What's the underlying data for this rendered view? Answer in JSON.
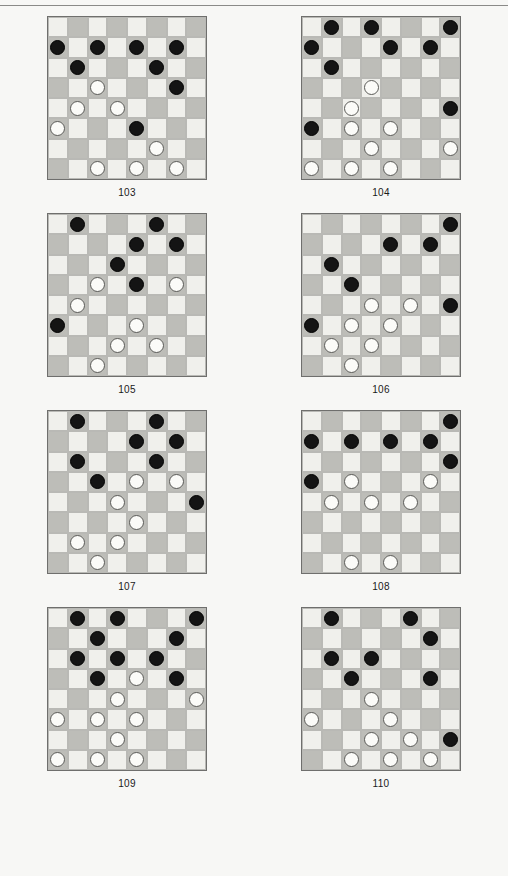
{
  "page": {
    "background_color": "#f7f7f5",
    "has_top_rule": true,
    "rule_color": "#8a8a88"
  },
  "board_style": {
    "light_square_color": "#f0f0ec",
    "dark_square_color": "#bdbdb8",
    "black_piece_color": "#141414",
    "white_piece_color": "#fbfbf8",
    "size": 8
  },
  "puzzles": [
    {
      "label": "103",
      "rows": [
        [
          "",
          "",
          "",
          "",
          "",
          "",
          "",
          ""
        ],
        [
          "b",
          "",
          "b",
          "",
          "b",
          "",
          "b",
          ""
        ],
        [
          "",
          "b",
          "",
          "",
          "",
          "b",
          "",
          ""
        ],
        [
          "",
          "",
          "w",
          "",
          "",
          "",
          "b",
          ""
        ],
        [
          "",
          "w",
          "",
          "w",
          "",
          "",
          "",
          ""
        ],
        [
          "w",
          "",
          "",
          "",
          "b",
          "",
          "",
          ""
        ],
        [
          "",
          "",
          "",
          "",
          "",
          "w",
          "",
          ""
        ],
        [
          "",
          "",
          "w",
          "",
          "w",
          "",
          "w",
          ""
        ]
      ]
    },
    {
      "label": "104",
      "rows": [
        [
          "",
          "b",
          "",
          "b",
          "",
          "",
          "",
          "b"
        ],
        [
          "b",
          "",
          "",
          "",
          "b",
          "",
          "b",
          ""
        ],
        [
          "",
          "b",
          "",
          "",
          "",
          "",
          "",
          ""
        ],
        [
          "",
          "",
          "",
          "w",
          "",
          "",
          "",
          ""
        ],
        [
          "",
          "",
          "w",
          "",
          "",
          "",
          "",
          "b"
        ],
        [
          "b",
          "",
          "w",
          "",
          "w",
          "",
          "",
          ""
        ],
        [
          "",
          "",
          "",
          "w",
          "",
          "",
          "",
          "w"
        ],
        [
          "w",
          "",
          "w",
          "",
          "w",
          "",
          "",
          ""
        ]
      ]
    },
    {
      "label": "105",
      "rows": [
        [
          "",
          "b",
          "",
          "",
          "",
          "b",
          "",
          ""
        ],
        [
          "",
          "",
          "",
          "",
          "b",
          "",
          "b",
          ""
        ],
        [
          "",
          "",
          "",
          "b",
          "",
          "",
          "",
          ""
        ],
        [
          "",
          "",
          "w",
          "",
          "b",
          "",
          "w",
          ""
        ],
        [
          "",
          "w",
          "",
          "",
          "",
          "",
          "",
          ""
        ],
        [
          "b",
          "",
          "",
          "",
          "w",
          "",
          "",
          ""
        ],
        [
          "",
          "",
          "",
          "w",
          "",
          "w",
          "",
          ""
        ],
        [
          "",
          "",
          "w",
          "",
          "",
          "",
          "",
          ""
        ]
      ]
    },
    {
      "label": "106",
      "rows": [
        [
          "",
          "",
          "",
          "",
          "",
          "",
          "",
          "b"
        ],
        [
          "",
          "",
          "",
          "",
          "b",
          "",
          "b",
          ""
        ],
        [
          "",
          "b",
          "",
          "",
          "",
          "",
          "",
          ""
        ],
        [
          "",
          "",
          "b",
          "",
          "",
          "",
          "",
          ""
        ],
        [
          "",
          "",
          "",
          "w",
          "",
          "w",
          "",
          "b"
        ],
        [
          "b",
          "",
          "w",
          "",
          "w",
          "",
          "",
          ""
        ],
        [
          "",
          "w",
          "",
          "w",
          "",
          "",
          "",
          ""
        ],
        [
          "",
          "",
          "w",
          "",
          "",
          "",
          "",
          ""
        ]
      ]
    },
    {
      "label": "107",
      "rows": [
        [
          "",
          "b",
          "",
          "",
          "",
          "b",
          "",
          ""
        ],
        [
          "",
          "",
          "",
          "",
          "b",
          "",
          "b",
          ""
        ],
        [
          "",
          "b",
          "",
          "",
          "",
          "b",
          "",
          ""
        ],
        [
          "",
          "",
          "b",
          "",
          "w",
          "",
          "w",
          ""
        ],
        [
          "",
          "",
          "",
          "w",
          "",
          "",
          "",
          "b"
        ],
        [
          "",
          "",
          "",
          "",
          "w",
          "",
          "",
          ""
        ],
        [
          "",
          "w",
          "",
          "w",
          "",
          "",
          "",
          ""
        ],
        [
          "",
          "",
          "w",
          "",
          "",
          "",
          "",
          ""
        ]
      ]
    },
    {
      "label": "108",
      "rows": [
        [
          "",
          "",
          "",
          "",
          "",
          "",
          "",
          "b"
        ],
        [
          "b",
          "",
          "b",
          "",
          "b",
          "",
          "b",
          ""
        ],
        [
          "",
          "",
          "",
          "",
          "",
          "",
          "",
          "b"
        ],
        [
          "b",
          "",
          "w",
          "",
          "",
          "",
          "w",
          ""
        ],
        [
          "",
          "w",
          "",
          "w",
          "",
          "w",
          "",
          ""
        ],
        [
          "",
          "",
          "",
          "",
          "",
          "",
          "",
          ""
        ],
        [
          "",
          "",
          "",
          "",
          "",
          "",
          "",
          ""
        ],
        [
          "",
          "",
          "w",
          "",
          "w",
          "",
          "",
          ""
        ]
      ]
    },
    {
      "label": "109",
      "rows": [
        [
          "",
          "b",
          "",
          "b",
          "",
          "",
          "",
          "b"
        ],
        [
          "",
          "",
          "b",
          "",
          "",
          "",
          "b",
          ""
        ],
        [
          "",
          "b",
          "",
          "b",
          "",
          "b",
          "",
          ""
        ],
        [
          "",
          "",
          "b",
          "",
          "w",
          "",
          "b",
          ""
        ],
        [
          "",
          "",
          "",
          "w",
          "",
          "",
          "",
          "w"
        ],
        [
          "w",
          "",
          "w",
          "",
          "w",
          "",
          "",
          ""
        ],
        [
          "",
          "",
          "",
          "w",
          "",
          "",
          "",
          ""
        ],
        [
          "w",
          "",
          "w",
          "",
          "w",
          "",
          "",
          ""
        ]
      ]
    },
    {
      "label": "110",
      "rows": [
        [
          "",
          "b",
          "",
          "",
          "",
          "b",
          "",
          ""
        ],
        [
          "",
          "",
          "",
          "",
          "",
          "",
          "b",
          ""
        ],
        [
          "",
          "b",
          "",
          "b",
          "",
          "",
          "",
          ""
        ],
        [
          "",
          "",
          "b",
          "",
          "",
          "",
          "b",
          ""
        ],
        [
          "",
          "",
          "",
          "w",
          "",
          "",
          "",
          ""
        ],
        [
          "w",
          "",
          "",
          "",
          "w",
          "",
          "",
          ""
        ],
        [
          "",
          "",
          "",
          "w",
          "",
          "w",
          "",
          "b"
        ],
        [
          "",
          "",
          "w",
          "",
          "w",
          "",
          "w",
          ""
        ]
      ]
    }
  ]
}
